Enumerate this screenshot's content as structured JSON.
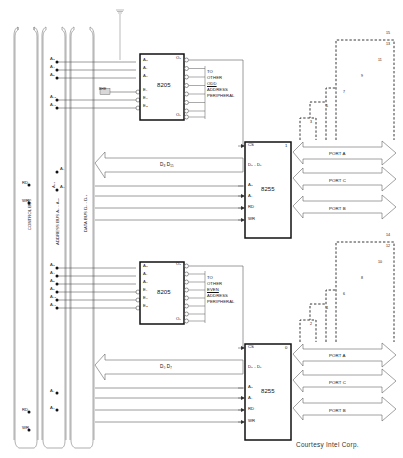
{
  "figure": {
    "caption": "Courtesy Intel Corp."
  },
  "buses": [
    {
      "id": "control",
      "label": "CONTROL BUS",
      "taps": [
        "RD",
        "WR",
        "RD",
        "WR"
      ]
    },
    {
      "id": "address",
      "label": "ADDRESS BUS A₀ - A₁₉",
      "taps_upper": [
        "A₃",
        "A₄",
        "A₅",
        "A₁₆",
        "A₁₉"
      ],
      "taps_mid": [
        "A₁₆",
        "A₁",
        " A₂"
      ],
      "taps_lower": [
        "A₃",
        "A₄",
        "A₅",
        "A₆",
        "A₁₆",
        "A₁₉",
        "A₁",
        "A₂"
      ]
    },
    {
      "id": "data",
      "label": "DATA BUS D₀ - D₁₅"
    }
  ],
  "bus_vertical_labels": {
    "control": "CONTROL BUS",
    "address": "ADDRESS BUS A₀ - A₁₉",
    "data": "DATA BUS D₀ - D₁₅",
    "a16": "A₁₆",
    "a1": "A₁",
    "a2": "A₂"
  },
  "decoders": [
    {
      "id": "decoder-odd",
      "name": "8205",
      "inputs": [
        "A₀",
        "A₁",
        "A₂",
        "E₁",
        "E₂",
        "E₃"
      ],
      "outputs_first": "O₀",
      "outputs_last": "O₇",
      "enable_signal": "BHE",
      "note_lines": [
        "TO",
        "OTHER",
        "ODD",
        "ADDRESS",
        "PERIPHERAL"
      ],
      "note_underlined": "ODD"
    },
    {
      "id": "decoder-even",
      "name": "8205",
      "inputs": [
        "A₀",
        "A₁",
        "A₂",
        "E₁",
        "E₂",
        "E₃"
      ],
      "outputs_first": "O₀",
      "outputs_last": "O₇",
      "enable_signal": "",
      "note_lines": [
        "TO",
        "OTHER",
        "EVEN",
        "ADDRESS",
        "PERIPHERAL"
      ],
      "note_underlined": "EVEN"
    }
  ],
  "ppis": [
    {
      "id": "ppi-odd",
      "name": "8255",
      "index": "1",
      "pins": [
        "CS",
        "D₀ - D₇",
        "A₀",
        "A₁",
        "RD",
        "WR"
      ],
      "ports": [
        "PORT A",
        "PORT C",
        "PORT B"
      ],
      "data_arrow_label": "D₈  D₁₅"
    },
    {
      "id": "ppi-even",
      "name": "8255",
      "index": "0",
      "pins": [
        "CS",
        "D₀ - D₇",
        "A₀",
        "A₁",
        "RD",
        "WR"
      ],
      "ports": [
        "PORT A",
        "PORT C",
        "PORT B"
      ],
      "data_arrow_label": "D₀  D₇"
    }
  ],
  "peripheral_stacks": [
    {
      "id": "stack-odd",
      "numbers": [
        "3",
        "5",
        "7",
        "9",
        "11",
        "13",
        "15"
      ]
    },
    {
      "id": "stack-even",
      "numbers": [
        "2",
        "4",
        "6",
        "8",
        "10",
        "12",
        "14"
      ]
    }
  ],
  "colors": {
    "line": "#3a3a3a",
    "chip_border": "#111111",
    "dashed": "#222222",
    "background": "#ffffff"
  }
}
